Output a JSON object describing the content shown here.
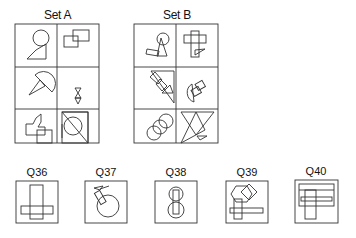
{
  "set_a": {
    "label": "Set A"
  },
  "set_b": {
    "label": "Set B"
  },
  "questions": [
    {
      "label": "Q36"
    },
    {
      "label": "Q37"
    },
    {
      "label": "Q38"
    },
    {
      "label": "Q39"
    },
    {
      "label": "Q40"
    }
  ],
  "colors": {
    "stroke": "#333333",
    "background": "#ffffff"
  }
}
